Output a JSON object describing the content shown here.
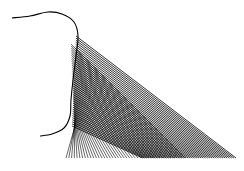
{
  "figure": {
    "stroke_color": "#000000",
    "background_color": "#ffffff",
    "width": 244,
    "height": 171,
    "curve": {
      "points": [
        [
          12,
          18
        ],
        [
          30,
          16
        ],
        [
          48,
          12
        ],
        [
          62,
          14
        ],
        [
          74,
          22
        ],
        [
          78,
          36
        ],
        [
          76,
          56
        ],
        [
          73,
          80
        ],
        [
          71,
          100
        ],
        [
          70,
          116
        ],
        [
          64,
          128
        ],
        [
          52,
          134
        ],
        [
          40,
          136
        ]
      ]
    },
    "fan": {
      "baseline_y": 158,
      "baseline_x_start": 66,
      "baseline_x_end": 236,
      "line_count": 44,
      "source_x": 76,
      "source_y_start": 36,
      "source_y_end": 126
    }
  }
}
